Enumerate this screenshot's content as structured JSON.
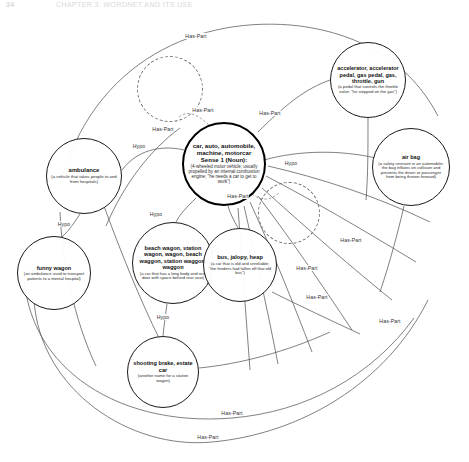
{
  "header": {
    "folio": "34",
    "running_title": "CHAPTER 3. WORDNET AND ITS USE"
  },
  "diagram": {
    "relation_labels": {
      "has_part": "Has-Part",
      "hypo": "Hypo"
    },
    "nodes": [
      {
        "id": "car",
        "words": "car, auto, automobile, machine, motorcar",
        "sense": "Sense 1 (Noun):",
        "gloss": "(4-wheeled motor vehicle; usually propelled by an internal combustion engine; \"he needs a car to get to work\")",
        "style": "focus"
      },
      {
        "id": "accelerator",
        "words": "accelerator, accelerator pedal, gas pedal, gas, throttle, gun",
        "gloss": "(a pedal that controls the throttle valve; \"he stepped on the gas\")",
        "style": "normal"
      },
      {
        "id": "air-bag",
        "words": "air bag",
        "gloss": "(a safety restraint in an automobile; the bag inflates on collision and prevents the driver or passenger from being thrown forward)",
        "style": "normal"
      },
      {
        "id": "ambulance",
        "words": "ambulance",
        "gloss": "(a vehicle that takes people to and from hospitals)",
        "style": "normal"
      },
      {
        "id": "funny-wagon",
        "words": "funny wagon",
        "gloss": "(an ambulance used to transport patients to a mental hospital)",
        "style": "normal"
      },
      {
        "id": "beach-wagon",
        "words": "beach wagon, station wagon, wagon, beach waggon, station waggon, waggon",
        "gloss": "(a car that has a long body and rear door with space behind rear seat)",
        "style": "normal"
      },
      {
        "id": "bus",
        "words": "bus, jalopy, heap",
        "gloss": "(a car that is old and unreliable; \"the fenders had fallen off that old bus\")",
        "style": "normal"
      },
      {
        "id": "shooting-brake",
        "words": "shooting brake, estate car",
        "gloss": "(another name for a station wagon)",
        "style": "normal"
      },
      {
        "id": "unlabeled-1",
        "words": "",
        "gloss": "",
        "style": "ghost"
      },
      {
        "id": "unlabeled-2",
        "words": "",
        "gloss": "",
        "style": "ghost"
      }
    ],
    "edges": [
      {
        "from": "car",
        "to": "accelerator",
        "label": "Has-Part"
      },
      {
        "from": "car",
        "to": "air-bag",
        "label": "Has-Part"
      },
      {
        "from": "car",
        "to": "unlabeled-1",
        "label": "Has-Part"
      },
      {
        "from": "car",
        "to": "unlabeled-2",
        "label": "Has-Part"
      },
      {
        "from": "car",
        "to": "ambulance",
        "label": "Hypo"
      },
      {
        "from": "car",
        "to": "beach-wagon",
        "label": "Hypo"
      },
      {
        "from": "car",
        "to": "bus",
        "label": "Hypo"
      },
      {
        "from": "ambulance",
        "to": "funny-wagon",
        "label": "Hypo"
      },
      {
        "from": "beach-wagon",
        "to": "shooting-brake",
        "label": "Hypo"
      },
      {
        "from": "car",
        "to": "other-parts-1",
        "label": "Has-Part"
      },
      {
        "from": "car",
        "to": "other-parts-2",
        "label": "Has-Part"
      },
      {
        "from": "car",
        "to": "other-parts-3",
        "label": "Has-Part"
      },
      {
        "from": "car",
        "to": "other-parts-4",
        "label": "Has-Part"
      },
      {
        "from": "car",
        "to": "other-parts-5",
        "label": "Has-Part"
      },
      {
        "from": "car",
        "to": "other-parts-6",
        "label": "Has-Part"
      }
    ],
    "edge_label_positions": [
      {
        "label": "Has-Part",
        "x": 196,
        "y": 36
      },
      {
        "label": "Has-Part",
        "x": 203,
        "y": 110
      },
      {
        "label": "Has-Part",
        "x": 163,
        "y": 129
      },
      {
        "label": "Has-Part",
        "x": 270,
        "y": 113
      },
      {
        "label": "Has-Part",
        "x": 238,
        "y": 196
      },
      {
        "label": "Has-Part",
        "x": 351,
        "y": 240
      },
      {
        "label": "Has-Part",
        "x": 307,
        "y": 268
      },
      {
        "label": "Has-Part",
        "x": 317,
        "y": 297
      },
      {
        "label": "Has-Part",
        "x": 390,
        "y": 321
      },
      {
        "label": "Has-Part",
        "x": 232,
        "y": 413
      },
      {
        "label": "Has-Part",
        "x": 208,
        "y": 437
      },
      {
        "label": "Hypo",
        "x": 139,
        "y": 146
      },
      {
        "label": "Hypo",
        "x": 291,
        "y": 163
      },
      {
        "label": "Hypo",
        "x": 156,
        "y": 214
      },
      {
        "label": "Hypo",
        "x": 64,
        "y": 224
      },
      {
        "label": "Hypo",
        "x": 163,
        "y": 317
      }
    ]
  }
}
